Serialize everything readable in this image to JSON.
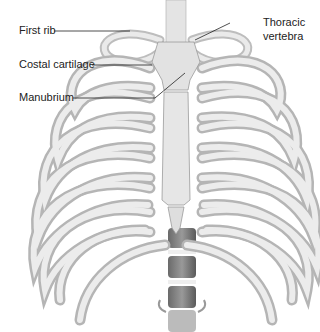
{
  "figure": {
    "labels": {
      "first_rib": "First rib",
      "costal_cartilage": "Costal cartilage",
      "manubrium": "Manubrium",
      "thoracic_vertebra_line1": "Thoracic",
      "thoracic_vertebra_line2": "vertebra"
    }
  },
  "colors": {
    "background": "#ffffff",
    "bone_light": "#e8e8e8",
    "bone_mid": "#c8c8c8",
    "bone_shadow": "#8a8a8a",
    "vertebra_dark": "#555555",
    "leader_line": "#222222"
  }
}
